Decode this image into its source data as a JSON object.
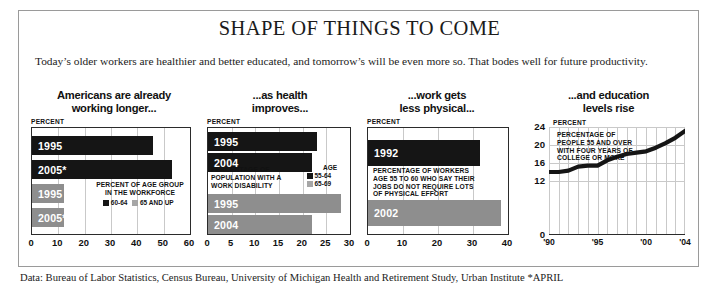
{
  "figure": {
    "title": "SHAPE OF THINGS TO COME",
    "deck": "Today’s older workers are healthier and better educated, and tomorrow’s will be even more so. That bodes well for future productivity.",
    "source": "Data: Bureau of Labor Statistics, Census Bureau, University of Michigan Health and Retirement Study, Urban Institute *APRIL",
    "colors": {
      "dark": "#151515",
      "grey": "#8e8e8e",
      "grid": "#c9c9c9",
      "frame": "#2b2b2b"
    }
  },
  "panels": [
    {
      "heading": "Americans are already\nworking longer...",
      "unit": "PERCENT",
      "note": "PERCENT OF AGE GROUP\nIN THE WORKFORCE",
      "legend_title": "",
      "legend": [
        {
          "label": "60-64",
          "color": "dark"
        },
        {
          "label": "65 AND UP",
          "color": "grey"
        }
      ],
      "ticks": [
        "0",
        "10",
        "20",
        "30",
        "40",
        "50",
        "60"
      ]
    },
    {
      "heading": "...as health\nimproves...",
      "unit": "PERCENT",
      "note": "PERCENTAGE OF\nPOPULATION WITH A\nWORK DISABILITY",
      "legend_title": "AGE",
      "legend": [
        {
          "label": "55-64",
          "color": "dark"
        },
        {
          "label": "65-69",
          "color": "grey"
        }
      ],
      "ticks": [
        "0",
        "5",
        "10",
        "15",
        "20",
        "25",
        "30"
      ]
    },
    {
      "heading": "...work gets\nless physical...",
      "unit": "PERCENT",
      "note": "PERCENTAGE OF WORKERS\nAGE 55 TO 60 WHO SAY THEIR\nJOBS DO NOT REQUIRE LOTS\nOF PHYSICAL EFFORT",
      "legend_title": "",
      "legend": [],
      "ticks": [
        "0",
        "10",
        "20",
        "30",
        "40"
      ]
    },
    {
      "heading": "...and education\nlevels rise",
      "unit": "PERCENT",
      "note": "PERCENTAGE OF\nPEOPLE 55 AND OVER\nWITH FOUR YEARS OF\nCOLLEGE OR MORE",
      "legend_title": "",
      "legend": [],
      "ticks": [
        "'90",
        "'95",
        "'00",
        "'04"
      ]
    }
  ],
  "chart_data": [
    {
      "type": "bar",
      "orientation": "horizontal",
      "title": "Americans are already working longer...",
      "subtitle": "PERCENT OF AGE GROUP IN THE WORKFORCE",
      "xlabel": "PERCENT",
      "ylabel": "",
      "xlim": [
        0,
        60
      ],
      "xticks": [
        0,
        10,
        20,
        30,
        40,
        50,
        60
      ],
      "grid": true,
      "categories": [
        "1995",
        "2005*"
      ],
      "series": [
        {
          "name": "60-64",
          "color": "#151515",
          "values": [
            46,
            53
          ]
        },
        {
          "name": "65 AND UP",
          "color": "#8e8e8e",
          "values": [
            12,
            12
          ]
        }
      ]
    },
    {
      "type": "bar",
      "orientation": "horizontal",
      "title": "...as health improves...",
      "subtitle": "PERCENTAGE OF POPULATION WITH A WORK DISABILITY",
      "xlabel": "PERCENT",
      "ylabel": "",
      "xlim": [
        0,
        30
      ],
      "xticks": [
        0,
        5,
        10,
        15,
        20,
        25,
        30
      ],
      "grid": true,
      "categories": [
        "1995",
        "2004"
      ],
      "series": [
        {
          "name": "55-64",
          "color": "#151515",
          "values": [
            23,
            22
          ]
        },
        {
          "name": "65-69",
          "color": "#8e8e8e",
          "values": [
            28,
            22
          ]
        }
      ]
    },
    {
      "type": "bar",
      "orientation": "horizontal",
      "title": "...work gets less physical...",
      "subtitle": "PERCENTAGE OF WORKERS AGE 55 TO 60 WHO SAY THEIR JOBS DO NOT REQUIRE LOTS OF PHYSICAL EFFORT",
      "xlabel": "PERCENT",
      "ylabel": "",
      "xlim": [
        0,
        40
      ],
      "xticks": [
        0,
        10,
        20,
        30,
        40
      ],
      "grid": true,
      "categories": [
        "1992",
        "2002"
      ],
      "values": [
        32,
        38
      ],
      "colors": [
        "#151515",
        "#8e8e8e"
      ]
    },
    {
      "type": "line",
      "title": "...and education levels rise",
      "subtitle": "PERCENTAGE OF PEOPLE 55 AND OVER WITH FOUR YEARS OF COLLEGE OR MORE",
      "xlabel": "",
      "ylabel": "PERCENT",
      "ylim": [
        0,
        24
      ],
      "yticks": [
        0,
        12,
        16,
        20,
        24
      ],
      "xlim": [
        "1990",
        "2004"
      ],
      "xticks": [
        "'90",
        "'95",
        "'00",
        "'04"
      ],
      "grid": true,
      "x": [
        1990,
        1991,
        1992,
        1993,
        1994,
        1995,
        1996,
        1997,
        1998,
        1999,
        2000,
        2001,
        2002,
        2003,
        2004
      ],
      "values": [
        14.0,
        14.0,
        14.3,
        15.2,
        15.4,
        15.4,
        16.6,
        17.4,
        18.0,
        18.3,
        18.6,
        19.4,
        20.4,
        21.6,
        23.1
      ]
    }
  ]
}
